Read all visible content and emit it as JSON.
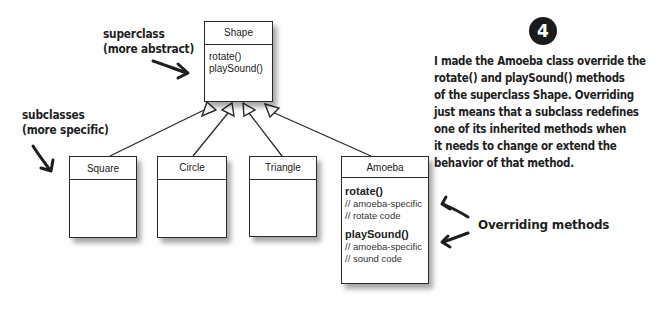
{
  "step_badge": "4",
  "labels": {
    "superclass": {
      "line1": "superclass",
      "line2": "(more abstract)"
    },
    "subclasses": {
      "line1": "subclasses",
      "line2": "(more specific)"
    },
    "overriding": "Overriding methods"
  },
  "note": {
    "lines": [
      "I made the Amoeba class override the",
      "rotate() and playSound() methods",
      "of the superclass Shape. Overriding",
      "just means that a subclass redefines",
      "one of its inherited methods when",
      "it needs to change or extend the",
      "behavior of that method."
    ]
  },
  "classes": {
    "shape": {
      "name": "Shape",
      "methods": [
        "rotate()",
        "playSound()"
      ]
    },
    "square": {
      "name": "Square"
    },
    "circle": {
      "name": "Circle"
    },
    "triangle": {
      "name": "Triangle"
    },
    "amoeba": {
      "name": "Amoeba",
      "methods": [
        {
          "name": "rotate()",
          "comments": [
            "// amoeba-specific",
            "// rotate code"
          ]
        },
        {
          "name": "playSound()",
          "comments": [
            "// amoeba-specific",
            "// sound code"
          ]
        }
      ]
    }
  },
  "colors": {
    "ink": "#1e1e1e",
    "box_border": "#2a2a2a",
    "background": "#ffffff"
  }
}
